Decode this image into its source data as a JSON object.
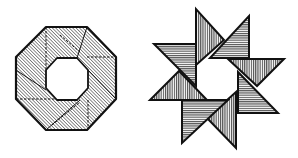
{
  "figure": {
    "colors": {
      "ink": "#111111",
      "paper": "#ffffff"
    },
    "octagon_ring": {
      "label": "octagon-ring",
      "outer": [
        [
          46,
          27
        ],
        [
          87,
          27
        ],
        [
          116,
          57
        ],
        [
          116,
          99
        ],
        [
          87,
          130
        ],
        [
          46,
          130
        ],
        [
          16,
          99
        ],
        [
          16,
          57
        ]
      ],
      "inner": [
        [
          57,
          58
        ],
        [
          77,
          58
        ],
        [
          88,
          70
        ],
        [
          88,
          88
        ],
        [
          77,
          100
        ],
        [
          57,
          100
        ],
        [
          46,
          88
        ],
        [
          46,
          70
        ]
      ],
      "fold_lines_dashed": [
        [
          [
            46,
            27
          ],
          [
            46,
            70
          ]
        ],
        [
          [
            87,
            57
          ],
          [
            116,
            57
          ]
        ],
        [
          [
            88,
            100
          ],
          [
            88,
            130
          ]
        ],
        [
          [
            16,
            99
          ],
          [
            57,
            99
          ]
        ],
        [
          [
            52,
            125
          ],
          [
            79,
            103
          ]
        ],
        [
          [
            60,
            35
          ],
          [
            80,
            52
          ]
        ]
      ],
      "fold_lines_solid": [
        [
          [
            16,
            70
          ],
          [
            46,
            90
          ]
        ],
        [
          [
            88,
            70
          ],
          [
            116,
            99
          ]
        ],
        [
          [
            46,
            130
          ],
          [
            80,
            100
          ]
        ],
        [
          [
            87,
            27
          ],
          [
            77,
            58
          ]
        ]
      ]
    },
    "pinwheel_star": {
      "label": "eight-pointed-star",
      "triangles": [
        {
          "hatch": "vertical",
          "points": [
            [
              196,
              9
            ],
            [
              196,
              65
            ],
            [
              224,
              40
            ]
          ]
        },
        {
          "hatch": "horizontal",
          "points": [
            [
              249,
              16
            ],
            [
              249,
              58
            ],
            [
              210,
              58
            ]
          ]
        },
        {
          "hatch": "vertical",
          "points": [
            [
              228,
              59
            ],
            [
              284,
              59
            ],
            [
              257,
              86
            ]
          ]
        },
        {
          "hatch": "horizontal",
          "points": [
            [
              238,
              72
            ],
            [
              238,
              113
            ],
            [
              278,
              113
            ]
          ]
        },
        {
          "hatch": "vertical",
          "points": [
            [
              236,
              92
            ],
            [
              236,
              148
            ],
            [
              207,
              118
            ]
          ]
        },
        {
          "hatch": "horizontal",
          "points": [
            [
              182,
              100
            ],
            [
              228,
              100
            ],
            [
              182,
              143
            ]
          ]
        },
        {
          "hatch": "vertical",
          "points": [
            [
              150,
              100
            ],
            [
              207,
              100
            ],
            [
              179,
              71
            ]
          ]
        },
        {
          "hatch": "horizontal",
          "points": [
            [
              154,
              44
            ],
            [
              196,
              44
            ],
            [
              196,
              86
            ]
          ]
        }
      ]
    }
  }
}
